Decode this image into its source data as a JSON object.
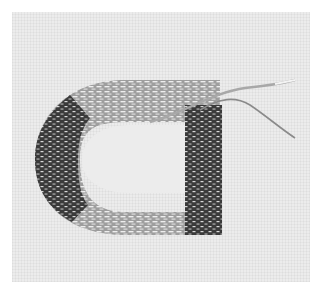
{
  "image": {
    "subject": "goldwork-embroidery-couched-metal-thread",
    "description": "Couched metallic thread embroidery in a D-shaped loop on linen, with loose thread ends trailing to the upper right",
    "colors": {
      "border": "#ffffff",
      "linen": "#ececec",
      "thread_dark": "#2e2e2e",
      "thread_mid": "#7a7a7a",
      "thread_light": "#c8c8c8",
      "highlight": "#f2f2f2"
    }
  }
}
